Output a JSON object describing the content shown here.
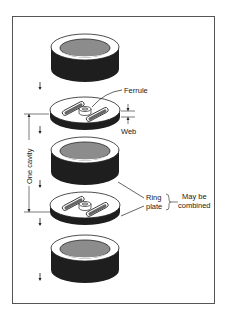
{
  "diagram": {
    "labels": {
      "ferrule": "Ferrule",
      "web": "Web",
      "one_cavity": "One cavity",
      "ring": "Ring",
      "plate": "plate",
      "may_be": "May be",
      "combined": "combined"
    },
    "components": [
      {
        "type": "ring",
        "order": 1
      },
      {
        "type": "plate",
        "order": 2
      },
      {
        "type": "ring",
        "order": 3
      },
      {
        "type": "plate",
        "order": 4
      },
      {
        "type": "ring",
        "order": 5
      }
    ],
    "colors": {
      "ring_side": "#1e1e1e",
      "ring_inner": "#8c8c8c",
      "outline": "#222222",
      "frame": "#555555"
    }
  }
}
